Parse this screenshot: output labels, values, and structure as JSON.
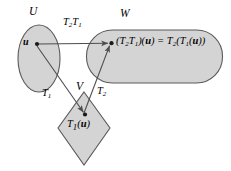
{
  "diagram": {
    "colors": {
      "region_fill": "#d4d4d4",
      "region_stroke": "#5a5a5a",
      "arrow_stroke": "#4d4d4d",
      "dot": "#1a1a1a",
      "background": "#ffffff",
      "text": "#000000"
    },
    "regions": [
      {
        "id": "U",
        "label": "U",
        "shape": "ellipse",
        "label_x": 29,
        "label_y": 6
      },
      {
        "id": "W",
        "label": "W",
        "shape": "rounded-rectangle",
        "label_x": 120,
        "label_y": 8
      },
      {
        "id": "V",
        "label": "V",
        "shape": "diamond",
        "label_x": 76,
        "label_y": 81
      }
    ],
    "points": [
      {
        "id": "u",
        "region": "U",
        "x": 36,
        "y": 44,
        "label_prefix": "",
        "label_vector": "u",
        "label_suffix": "",
        "label_x": 23,
        "label_y": 37
      },
      {
        "id": "T1u",
        "region": "V",
        "x": 85,
        "y": 115,
        "label_prefix": "T",
        "label_sub": "1",
        "label_open": "(",
        "label_vector": "u",
        "label_close": ")",
        "label_x": 67,
        "label_y": 119
      },
      {
        "id": "T2T1u",
        "region": "W",
        "x": 111,
        "y": 43,
        "label_x": 116,
        "label_y": 36
      }
    ],
    "formula": {
      "lhs_open": "(",
      "lhs_T2": "T",
      "lhs_T2_sub": "2",
      "lhs_T1": "T",
      "lhs_T1_sub": "1",
      "lhs_close": ")(",
      "lhs_vector": "u",
      "lhs_end": ")",
      "equals": " = ",
      "rhs_T2": "T",
      "rhs_T2_sub": "2",
      "rhs_open": "(",
      "rhs_T1": "T",
      "rhs_T1_sub": "1",
      "rhs_inner_open": "(",
      "rhs_vector": "u",
      "rhs_close": "))"
    },
    "arrows": [
      {
        "id": "composite",
        "from": "u",
        "to": "T2T1u",
        "label_T_first": "T",
        "label_sub_first": "2",
        "label_T_second": "T",
        "label_sub_second": "1",
        "label_x": 63,
        "label_y": 17
      },
      {
        "id": "T1",
        "from": "u",
        "to": "T1u",
        "label_T": "T",
        "label_sub": "1",
        "label_x": 42,
        "label_y": 88
      },
      {
        "id": "T2",
        "from": "T1u",
        "to": "T2T1u",
        "label_T": "T",
        "label_sub": "2",
        "label_x": 97,
        "label_y": 86
      }
    ]
  }
}
